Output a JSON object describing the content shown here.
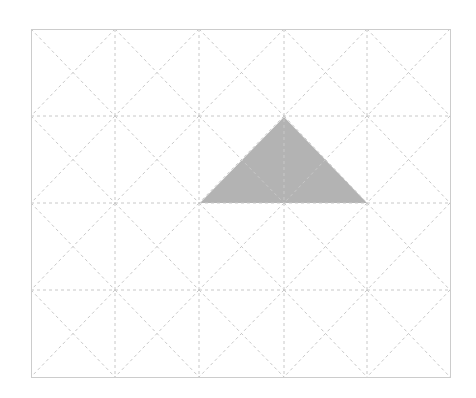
{
  "diagram": {
    "type": "tangram-grid",
    "grid": {
      "columns": 5,
      "rows": 4,
      "x_lines": [
        31,
        115,
        199,
        284,
        367,
        450
      ],
      "y_lines": [
        29,
        116,
        203,
        290,
        377
      ],
      "line_color": "#c8c8c8",
      "border_color": "#cccccc",
      "cell_diagonals": true,
      "line_style": "dashed"
    },
    "shapes": [
      {
        "kind": "triangle",
        "points": [
          [
            284,
            117
          ],
          [
            200,
            203
          ],
          [
            367,
            203
          ]
        ],
        "fill": "#b3b3b3"
      }
    ]
  }
}
